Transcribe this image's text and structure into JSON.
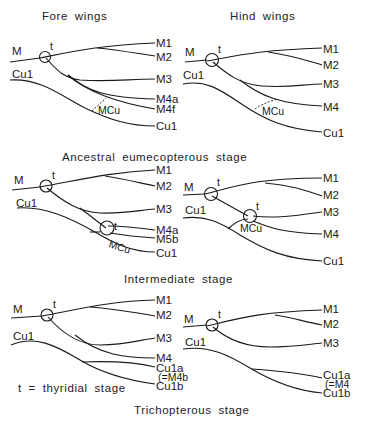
{
  "figure": {
    "column_headers": {
      "fore": "Fore wings",
      "hind": "Hind wings"
    },
    "stages": [
      {
        "name": "Ancestral eumecopterous stage",
        "fore": {
          "stem_labels": [
            "M",
            "Cu1"
          ],
          "terminal_labels": [
            "M1",
            "M2",
            "M3",
            "M4a",
            "M4f",
            "Cu1"
          ],
          "crossvein": "MCu",
          "node": "t"
        },
        "hind": {
          "stem_labels": [
            "M",
            "Cu1"
          ],
          "terminal_labels": [
            "M1",
            "M2",
            "M3",
            "M4",
            "Cu1"
          ],
          "crossvein": "MCu",
          "node": "t"
        }
      },
      {
        "name": "Intermediate stage",
        "fore": {
          "stem_labels": [
            "M",
            "Cu1"
          ],
          "terminal_labels": [
            "M1",
            "M2",
            "M3",
            "M4a",
            "M5b",
            "Cu1"
          ],
          "crossvein": "MCu",
          "node": "t",
          "secondary_node": "t"
        },
        "hind": {
          "stem_labels": [
            "M",
            "Cu1"
          ],
          "terminal_labels": [
            "M1",
            "M2",
            "M3",
            "M4",
            "Cu1"
          ],
          "crossvein": "MCu",
          "node": "t",
          "secondary_node": "t"
        }
      },
      {
        "name": "Trichopterous stage",
        "fore": {
          "stem_labels": [
            "M",
            "Cu1"
          ],
          "terminal_labels": [
            "M1",
            "M2",
            "M3",
            "M4",
            "Cu1a",
            "(=M4b",
            "Cu1b"
          ],
          "node": "t"
        },
        "hind": {
          "stem_labels": [
            "M",
            "Cu1"
          ],
          "terminal_labels": [
            "M1",
            "M2",
            "M3",
            "Cu1a",
            "(=M4",
            "Cu1b"
          ],
          "node": "t"
        }
      }
    ],
    "legend": "t = thyridial stage"
  }
}
